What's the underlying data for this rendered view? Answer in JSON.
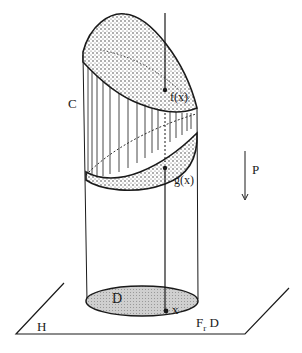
{
  "diagram": {
    "labels": {
      "C": "C",
      "f": "f(x)",
      "g": "g(x)",
      "P": "P",
      "D": "D",
      "x": "x",
      "Fr": "F",
      "Fr_sub": "r",
      "FrD": "D",
      "H": "H"
    },
    "colors": {
      "ink": "#1a1a1a",
      "region_fill": "#d4d4d4",
      "background": "#ffffff"
    }
  }
}
